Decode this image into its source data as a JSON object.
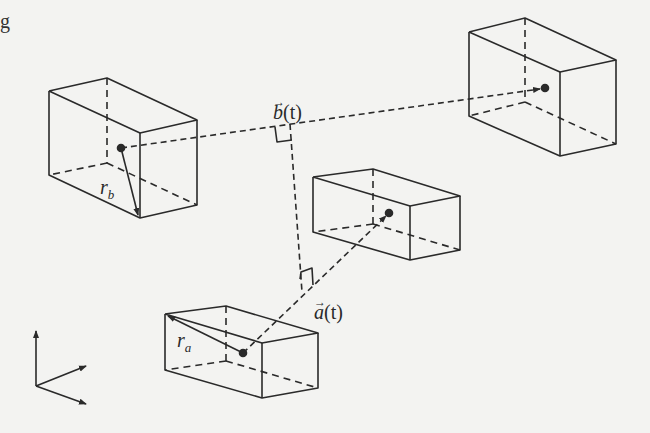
{
  "figure": {
    "corner_fragment": "g",
    "labels": {
      "b_vector": {
        "symbol": "b",
        "arg": "(t)",
        "arrow": "→"
      },
      "a_vector": {
        "symbol": "a",
        "arg": "(t)",
        "arrow": "→"
      },
      "r_b": {
        "base": "r",
        "sub": "b"
      },
      "r_a": {
        "base": "r",
        "sub": "a"
      }
    },
    "colors": {
      "ink": "#2a2a2a",
      "paper": "#f3f3f1"
    },
    "boxes": [
      {
        "name": "box-b-origin",
        "has_radius_arrow": true,
        "radius_label": "r_b"
      },
      {
        "name": "box-b-target",
        "has_radius_arrow": false
      },
      {
        "name": "box-a-target",
        "has_radius_arrow": false
      },
      {
        "name": "box-a-origin",
        "has_radius_arrow": true,
        "radius_label": "r_a"
      }
    ],
    "axes_glyph": "three-arrow coordinate frame"
  }
}
